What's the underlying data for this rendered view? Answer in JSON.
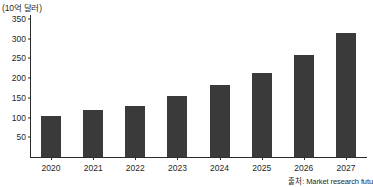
{
  "chart_data": {
    "type": "bar",
    "title": "",
    "subtitle": "",
    "unit_label": "(10억 달러)",
    "xlabel": "",
    "ylabel": "",
    "categories": [
      "2020",
      "2021",
      "2022",
      "2023",
      "2024",
      "2025",
      "2026",
      "2027"
    ],
    "values": [
      105,
      118,
      130,
      155,
      182,
      213,
      258,
      315
    ],
    "series": [
      {
        "name": "시장 규모",
        "values": [
          105,
          118,
          130,
          155,
          182,
          213,
          258,
          315
        ]
      }
    ],
    "ylim": [
      0,
      360
    ],
    "yticks": [
      50,
      100,
      150,
      200,
      250,
      300,
      350
    ],
    "ytick_labels": [
      "50",
      "100",
      "150",
      "200",
      "250",
      "300",
      "350"
    ],
    "grid": false,
    "legend": false,
    "legend_position": "none",
    "bar_color": "#3a3a3a",
    "axis_color": "#2b2b2b",
    "background_color": "#ffffff",
    "annotations": []
  },
  "source": {
    "text": "출처: Market research futu"
  }
}
